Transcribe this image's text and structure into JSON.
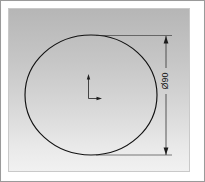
{
  "drawing": {
    "title": "Circle profile with diameter dimension",
    "background": {
      "gradient_top": "#b6b6b6",
      "gradient_bottom": "#f1f1f1",
      "border_color": "#9a9a9a"
    },
    "geometry": {
      "shape_name": "circle",
      "stroke_color": "#111111",
      "center_x": 91,
      "center_y": 95,
      "radius_x": 66,
      "radius_y": 60
    },
    "origin_marker": {
      "name": "coordinate-origin",
      "x_axis_label": "X",
      "y_axis_label": "Y",
      "color": "#1f1f1f"
    },
    "dimension": {
      "name": "diameter-dimension",
      "symbol": "Ø",
      "value": "90",
      "text": "Ø90",
      "orientation": "vertical",
      "rotation_deg": -90,
      "line_x": 166,
      "line_top_y": 36,
      "line_bottom_y": 155,
      "text_color": "#141414",
      "line_color": "#2a2a2a"
    },
    "extension_lines": [
      {
        "name": "extension-line-top",
        "y": 36,
        "x_start": 96,
        "x_end": 172
      },
      {
        "name": "extension-line-bottom",
        "y": 155,
        "x_start": 96,
        "x_end": 172
      }
    ]
  }
}
